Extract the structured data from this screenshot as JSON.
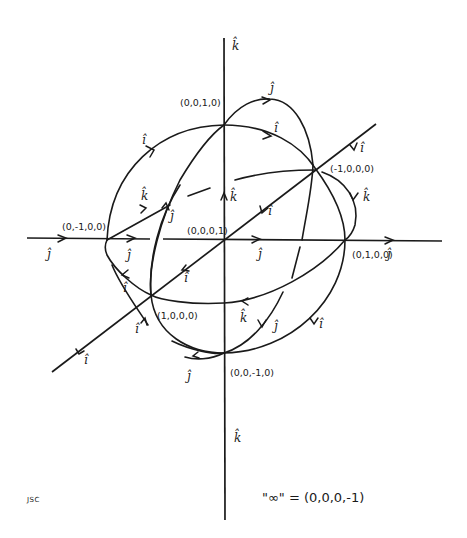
{
  "diagram": {
    "axes": {
      "vertical_top_label": "k̂",
      "vertical_bottom_label": "k̂",
      "horizontal_left_label": "ĵ",
      "horizontal_right_label": "ĵ",
      "diagonal_top_label": "î",
      "diagonal_bottom_label": "î"
    },
    "points": [
      {
        "id": "p_0010",
        "label": "(0,0,1,0)"
      },
      {
        "id": "p_m1000",
        "label": "(-1,0,0,0)"
      },
      {
        "id": "p_0100",
        "label": "(0,1,0,0)"
      },
      {
        "id": "p_0m100",
        "label": "(0,-1,0,0)"
      },
      {
        "id": "p_0001",
        "label": "(0,0,0,1)"
      },
      {
        "id": "p_1000",
        "label": "(1,0,0,0)"
      },
      {
        "id": "p_00m10",
        "label": "(0,0,-1,0)"
      }
    ],
    "curve_labels": {
      "i": "î",
      "j": "ĵ",
      "k": "k̂"
    },
    "infinity_note": "\"∞\" = (0,0,0,-1)",
    "signature": "JSC"
  }
}
